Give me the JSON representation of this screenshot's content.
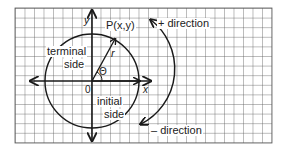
{
  "diagram": {
    "type": "unit-circle-angle",
    "labels": {
      "point": "P(x,y)",
      "plus_direction": "+ direction",
      "minus_direction": "– direction",
      "terminal": "terminal",
      "terminal_side": "side",
      "initial": "initial",
      "initial_side": "side",
      "origin": "0",
      "x_axis": "x",
      "y_axis": "y",
      "radius": "r",
      "angle": "Θ"
    },
    "colors": {
      "grid": "#555555",
      "stroke": "#1a1a1a",
      "background": "#ffffff"
    }
  }
}
